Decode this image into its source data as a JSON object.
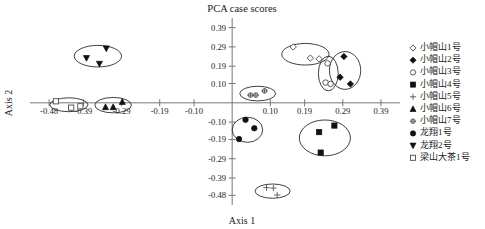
{
  "chart_data": {
    "type": "scatter",
    "title": "PCA case scores",
    "xlabel": "Axis 1",
    "ylabel": "Axis 2",
    "xlim": [
      -0.53,
      0.44
    ],
    "ylim": [
      -0.53,
      0.44
    ],
    "grid": false,
    "legend_position": "right",
    "xticks": [
      -0.48,
      -0.39,
      -0.29,
      -0.19,
      -0.1,
      0.1,
      0.19,
      0.29,
      0.39
    ],
    "xticklabels": [
      "-0.48",
      "-0.39",
      "-0.29",
      "-0.19",
      "-0.10",
      "0.10",
      "0.19",
      "0.29",
      "0.39"
    ],
    "yticks": [
      0.39,
      0.29,
      0.19,
      0.1,
      -0.1,
      -0.19,
      -0.29,
      -0.39,
      -0.48
    ],
    "yticklabels": [
      "0.39",
      "0.29",
      "0.19",
      "0.10",
      "-0.10",
      "-0.19",
      "-0.29",
      "-0.39",
      "-0.48"
    ],
    "series": [
      {
        "name": "小帽山1号",
        "marker": "diamond-open",
        "points": [
          [
            0.16,
            0.29
          ],
          [
            0.205,
            0.232
          ],
          [
            0.228,
            0.228
          ]
        ],
        "ellipse": {
          "cx": 0.192,
          "cy": 0.252,
          "rx": 0.062,
          "ry": 0.056,
          "rotate": 0
        }
      },
      {
        "name": "小帽山2号",
        "marker": "diamond-filled",
        "points": [
          [
            0.293,
            0.24
          ],
          [
            0.283,
            0.133
          ],
          [
            0.31,
            0.098
          ]
        ],
        "ellipse": {
          "cx": 0.296,
          "cy": 0.168,
          "rx": 0.041,
          "ry": 0.098,
          "rotate": 0
        }
      },
      {
        "name": "小帽山3号",
        "marker": "circle-open",
        "points": [
          [
            0.25,
            0.205
          ],
          [
            0.245,
            0.105
          ],
          [
            0.258,
            0.098
          ]
        ],
        "ellipse": {
          "cx": 0.252,
          "cy": 0.152,
          "rx": 0.026,
          "ry": 0.09,
          "rotate": 0
        }
      },
      {
        "name": "小帽山4号",
        "marker": "square-filled",
        "points": [
          [
            0.228,
            -0.152
          ],
          [
            0.268,
            -0.118
          ],
          [
            0.232,
            -0.258
          ]
        ],
        "ellipse": {
          "cx": 0.243,
          "cy": -0.182,
          "rx": 0.067,
          "ry": 0.093,
          "rotate": 0
        }
      },
      {
        "name": "小帽山5号",
        "marker": "plus",
        "points": [
          [
            0.09,
            -0.44
          ],
          [
            0.108,
            -0.442
          ],
          [
            0.118,
            -0.478
          ]
        ],
        "ellipse": {
          "cx": 0.106,
          "cy": -0.458,
          "rx": 0.046,
          "ry": 0.037,
          "rotate": 0
        }
      },
      {
        "name": "小帽山6号",
        "marker": "triangle-up-filled",
        "points": [
          [
            -0.332,
            -0.022
          ],
          [
            -0.312,
            -0.022
          ],
          [
            -0.288,
            0.005
          ]
        ],
        "ellipse": {
          "cx": -0.312,
          "cy": -0.012,
          "rx": 0.048,
          "ry": 0.04,
          "rotate": 0
        }
      },
      {
        "name": "小帽山7号",
        "marker": "circle-plus",
        "points": [
          [
            0.048,
            0.04
          ],
          [
            0.062,
            0.04
          ],
          [
            0.085,
            0.062
          ]
        ],
        "ellipse": {
          "cx": 0.067,
          "cy": 0.048,
          "rx": 0.047,
          "ry": 0.038,
          "rotate": 0
        }
      },
      {
        "name": "龙翔1号",
        "marker": "circle-filled",
        "points": [
          [
            0.035,
            -0.088
          ],
          [
            0.058,
            -0.132
          ],
          [
            0.018,
            -0.188
          ]
        ],
        "ellipse": {
          "cx": 0.04,
          "cy": -0.14,
          "rx": 0.04,
          "ry": 0.065,
          "rotate": 0
        }
      },
      {
        "name": "龙翔2号",
        "marker": "triangle-down-filled",
        "points": [
          [
            -0.33,
            0.282
          ],
          [
            -0.382,
            0.232
          ],
          [
            -0.348,
            0.202
          ]
        ],
        "ellipse": {
          "cx": -0.352,
          "cy": 0.242,
          "rx": 0.062,
          "ry": 0.056,
          "rotate": 0
        }
      },
      {
        "name": "梁山大茶1号",
        "marker": "square-open",
        "points": [
          [
            -0.462,
            0.008
          ],
          [
            -0.422,
            -0.025
          ],
          [
            -0.398,
            -0.018
          ]
        ],
        "ellipse": {
          "cx": -0.428,
          "cy": -0.01,
          "rx": 0.05,
          "ry": 0.036,
          "rotate": 0
        }
      }
    ]
  },
  "legend": {
    "items": [
      {
        "label": "小帽山1号",
        "marker": "diamond-open"
      },
      {
        "label": "小帽山2号",
        "marker": "diamond-filled"
      },
      {
        "label": "小帽山3号",
        "marker": "circle-open"
      },
      {
        "label": "小帽山4号",
        "marker": "square-filled"
      },
      {
        "label": "小帽山5号",
        "marker": "plus"
      },
      {
        "label": "小帽山6号",
        "marker": "triangle-up-filled"
      },
      {
        "label": "小帽山7号",
        "marker": "circle-plus"
      },
      {
        "label": "龙翔1号",
        "marker": "circle-filled"
      },
      {
        "label": "龙翔2号",
        "marker": "triangle-down-filled"
      },
      {
        "label": "梁山大茶1号",
        "marker": "square-open"
      }
    ]
  }
}
